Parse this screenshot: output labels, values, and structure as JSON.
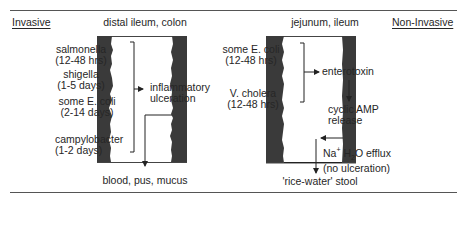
{
  "header": {
    "left_label": "Invasive",
    "right_label": "Non-Invasive"
  },
  "invasive": {
    "site": "distal ileum, colon",
    "organisms": [
      {
        "name": "salmonella",
        "duration": "(12-48 hrs)"
      },
      {
        "name": "shigella",
        "duration": "(1-5 days)"
      },
      {
        "name": "some E. coli",
        "duration": "(2-14 days)"
      },
      {
        "name": "campylobacter",
        "duration": "(1-2 days)"
      }
    ],
    "mechanism": [
      "inflammatory",
      "ulceration"
    ],
    "output": "blood, pus, mucus"
  },
  "non_invasive": {
    "site": "jejunum, ileum",
    "organisms": [
      {
        "name": "some E. coli",
        "duration": "(12-48 hrs)"
      },
      {
        "name": "V. cholera",
        "duration": "(12-48 hrs)"
      }
    ],
    "toxin": "enterotoxin",
    "step2": [
      "cyclic AMP",
      "release"
    ],
    "step3_line1_a": "Na",
    "step3_line1_sup": "+",
    "step3_line1_b": " H",
    "step3_line1_sub": "2",
    "step3_line1_c": "O efflux",
    "step3_line2": "(no ulceration)",
    "output": "'rice-water' stool"
  },
  "colors": {
    "wall": "#3a3a3a",
    "rule": "#555555",
    "text": "#262626"
  }
}
